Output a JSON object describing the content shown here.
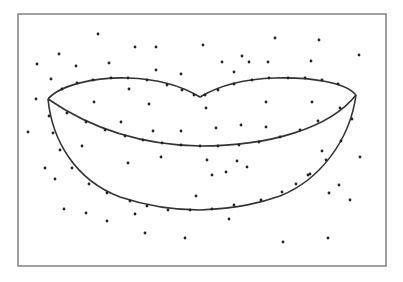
{
  "figure": {
    "frame": {
      "x": 18,
      "y": 14,
      "width": 368,
      "height": 252,
      "stroke": "#808080"
    },
    "curve_color": "#333333",
    "point_color": "#222222",
    "upper_lip_path": "M48,99 C60,85 95,77 128,78 C160,79 185,88 200,97 C215,88 240,79 275,78 C310,77 345,82 356,95",
    "middle_line_path": "M48,99 C90,128 140,145 200,146 C270,146 330,128 356,95",
    "lower_lip_path": "M48,99 C52,140 75,180 120,197 C150,207 175,210 200,210 C240,208 260,203 280,196 C320,180 350,140 356,95",
    "contour_points": [
      [
        62,
        89
      ],
      [
        77,
        83
      ],
      [
        93,
        80
      ],
      [
        111,
        78
      ],
      [
        128,
        78
      ],
      [
        147,
        80
      ],
      [
        167,
        85
      ],
      [
        182,
        90
      ],
      [
        194,
        95
      ],
      [
        205,
        95
      ],
      [
        218,
        90
      ],
      [
        234,
        84
      ],
      [
        252,
        80
      ],
      [
        269,
        78
      ],
      [
        288,
        78
      ],
      [
        305,
        78
      ],
      [
        322,
        80
      ],
      [
        338,
        84
      ],
      [
        67,
        113
      ],
      [
        86,
        122
      ],
      [
        105,
        130
      ],
      [
        125,
        136
      ],
      [
        143,
        140
      ],
      [
        162,
        143
      ],
      [
        181,
        145
      ],
      [
        200,
        146
      ],
      [
        218,
        146
      ],
      [
        239,
        145
      ],
      [
        259,
        142
      ],
      [
        280,
        137
      ],
      [
        300,
        130
      ],
      [
        318,
        121
      ],
      [
        340,
        108
      ],
      [
        49,
        116
      ],
      [
        53,
        133
      ],
      [
        60,
        150
      ],
      [
        72,
        168
      ],
      [
        89,
        184
      ],
      [
        107,
        193
      ],
      [
        130,
        201
      ],
      [
        147,
        206
      ],
      [
        168,
        210
      ],
      [
        190,
        210
      ],
      [
        212,
        209
      ],
      [
        234,
        205
      ],
      [
        261,
        200
      ],
      [
        282,
        192
      ],
      [
        296,
        184
      ],
      [
        310,
        174
      ],
      [
        326,
        160
      ],
      [
        341,
        141
      ],
      [
        352,
        119
      ]
    ],
    "scatter_points": [
      [
        98,
        34
      ],
      [
        135,
        47
      ],
      [
        156,
        47
      ],
      [
        59,
        54
      ],
      [
        37,
        64
      ],
      [
        76,
        66
      ],
      [
        109,
        63
      ],
      [
        156,
        70
      ],
      [
        275,
        38
      ],
      [
        319,
        40
      ],
      [
        203,
        45
      ],
      [
        242,
        56
      ],
      [
        249,
        62
      ],
      [
        268,
        62
      ],
      [
        311,
        61
      ],
      [
        359,
        55
      ],
      [
        222,
        62
      ],
      [
        181,
        74
      ],
      [
        234,
        72
      ],
      [
        51,
        79
      ],
      [
        129,
        89
      ],
      [
        36,
        99
      ],
      [
        94,
        102
      ],
      [
        149,
        104
      ],
      [
        206,
        108
      ],
      [
        266,
        102
      ],
      [
        312,
        102
      ],
      [
        121,
        122
      ],
      [
        181,
        131
      ],
      [
        216,
        128
      ],
      [
        241,
        125
      ],
      [
        28,
        132
      ],
      [
        153,
        131
      ],
      [
        266,
        127
      ],
      [
        322,
        151
      ],
      [
        82,
        146
      ],
      [
        161,
        157
      ],
      [
        207,
        160
      ],
      [
        360,
        157
      ],
      [
        45,
        168
      ],
      [
        128,
        163
      ],
      [
        55,
        179
      ],
      [
        237,
        161
      ],
      [
        212,
        175
      ],
      [
        247,
        167
      ],
      [
        308,
        175
      ],
      [
        339,
        185
      ],
      [
        350,
        200
      ],
      [
        329,
        193
      ],
      [
        196,
        196
      ],
      [
        226,
        172
      ],
      [
        64,
        209
      ],
      [
        86,
        213
      ],
      [
        107,
        221
      ],
      [
        135,
        214
      ],
      [
        145,
        233
      ],
      [
        185,
        238
      ],
      [
        229,
        219
      ],
      [
        283,
        242
      ],
      [
        328,
        238
      ]
    ]
  }
}
